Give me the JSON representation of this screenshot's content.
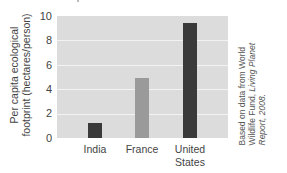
{
  "chart_data": {
    "type": "bar",
    "title": "",
    "categories": [
      "India",
      "France",
      "United States"
    ],
    "values": [
      1.2,
      4.9,
      9.4
    ],
    "xlabel": "",
    "ylabel": "Per capita ecological footprint (hectares/person)",
    "ylim": [
      0,
      10
    ],
    "yticks": [
      0,
      2,
      4,
      6,
      8,
      10
    ],
    "grid": true,
    "legend": null,
    "bar_colors": [
      "#3a3a3a",
      "#9a9a9a",
      "#3a3a3a"
    ],
    "annotation": "Based on data from World Wildlife Fund, Living Planet Report, 2008."
  },
  "axis": {
    "ylabel_line1": "Per capita ecological",
    "ylabel_line2": "footprint (hectares/person)",
    "yticks": [
      "10",
      "8",
      "6",
      "4",
      "2",
      "0"
    ]
  },
  "labels": {
    "india": "India",
    "france": "France",
    "us_line1": "United",
    "us_line2": "States"
  },
  "source": {
    "line1": "Based on data from World",
    "line2_plain": "Wildlife Fund, ",
    "line2_italic": "Living Planet",
    "line3_italic": "Report, 2008."
  },
  "colors": {
    "plot_bg": "#dcdcdc",
    "grid": "#f2f2f2",
    "dark_bar": "#3a3a3a",
    "light_bar": "#9a9a9a"
  }
}
